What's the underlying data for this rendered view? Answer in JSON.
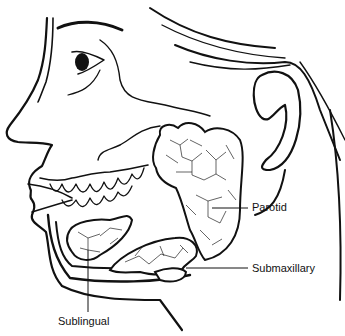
{
  "diagram": {
    "colors": {
      "ink": "#111111",
      "background": "#ffffff"
    },
    "labels": [
      {
        "id": "parotid",
        "text": "Parotid"
      },
      {
        "id": "submaxillary",
        "text": "Submaxillary"
      },
      {
        "id": "sublingual",
        "text": "Sublingual"
      }
    ]
  }
}
